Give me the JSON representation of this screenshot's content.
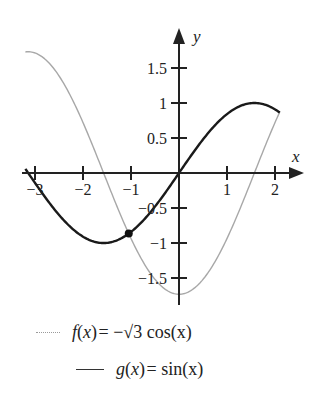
{
  "chart_data": {
    "type": "line",
    "title": "",
    "xlabel": "x",
    "ylabel": "y",
    "xlim": [
      -3.2,
      2.1
    ],
    "ylim": [
      -1.85,
      1.9
    ],
    "x_ticks": [
      -3,
      -2,
      -1,
      1,
      2
    ],
    "x_tick_labels": [
      "−3",
      "−2",
      "−1",
      "1",
      "2"
    ],
    "y_ticks": [
      1.5,
      1,
      0.5,
      -0.5,
      -1,
      -1.5
    ],
    "y_tick_labels": [
      "1.5",
      "1",
      "0.5",
      "−0.5",
      "−1",
      "−1.5"
    ],
    "grid": false,
    "legend_position": "bottom",
    "series": [
      {
        "name": "f(x) = −√3 cos(x)",
        "function": "-sqrt(3)*cos(x)",
        "x_range": [
          -3.2,
          2.1
        ],
        "color": "#a8a8a8",
        "style": "thin-gray"
      },
      {
        "name": "g(x) = sin(x)",
        "function": "sin(x)",
        "x_range": [
          -3.2,
          2.1
        ],
        "color": "#1a1a1a",
        "style": "solid-black"
      }
    ],
    "annotations": [
      {
        "type": "point",
        "label": "intersection",
        "x": -1.0472,
        "y": -0.866
      }
    ]
  },
  "axes": {
    "x_label": "x",
    "y_label": "y"
  },
  "legend": {
    "f": {
      "name": "f",
      "arg": "x",
      "expr": "= −√3 cos(x)",
      "text": "f(x) = −√3 cos(x)"
    },
    "g": {
      "name": "g",
      "arg": "x",
      "expr": "= sin(x)",
      "text": "g(x) = sin(x)"
    }
  }
}
